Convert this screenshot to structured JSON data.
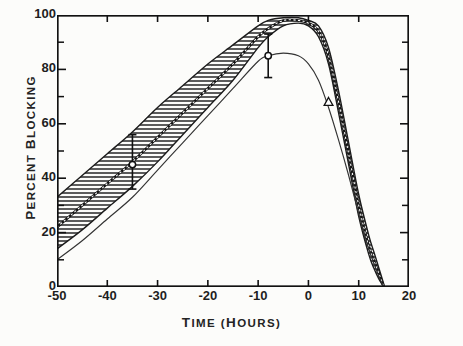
{
  "chart_data": {
    "type": "line",
    "title": "",
    "xlabel": "TIME (HOURS)",
    "ylabel": "PERCENT BLOCKING",
    "xlim": [
      -50,
      20
    ],
    "ylim": [
      0,
      100
    ],
    "xticks": [
      -50,
      -40,
      -30,
      -20,
      -10,
      0,
      10,
      20
    ],
    "xtick_labels": [
      "-50",
      "-40",
      "-30",
      "-20",
      "-10",
      "0",
      "10",
      "20"
    ],
    "yticks": [
      0,
      20,
      40,
      60,
      80,
      100
    ],
    "ytick_labels": [
      "0",
      "20",
      "40",
      "60",
      "80",
      "100"
    ],
    "yminor_ticks": [
      10,
      30,
      50,
      70,
      90
    ],
    "grid": false,
    "legend": "none",
    "series": [
      {
        "name": "Upper band limit",
        "comment": "upper edge of hatched confidence band",
        "x": [
          -50,
          -45,
          -40,
          -35,
          -30,
          -25,
          -20,
          -15,
          -10,
          -8,
          -5,
          -2,
          0,
          2,
          4,
          6,
          8,
          10,
          12,
          13,
          14,
          15
        ],
        "values": [
          33,
          41,
          49,
          57,
          66,
          74,
          82,
          89,
          96,
          98,
          99,
          99,
          98,
          96,
          88,
          72,
          53,
          34,
          19,
          13,
          7,
          1
        ]
      },
      {
        "name": "Lower band limit",
        "comment": "lower edge of hatched confidence band",
        "x": [
          -50,
          -45,
          -40,
          -35,
          -30,
          -25,
          -20,
          -15,
          -10,
          -8,
          -5,
          -2,
          0,
          2,
          4,
          6,
          8,
          10,
          12,
          13,
          14,
          15
        ],
        "values": [
          14,
          21,
          29,
          37,
          46,
          56,
          66,
          76,
          88,
          92,
          96,
          97,
          96,
          92,
          82,
          64,
          45,
          26,
          12,
          7,
          3,
          0
        ]
      },
      {
        "name": "Band centre curve",
        "comment": "solid mean line drawn through the hatched band",
        "x": [
          -50,
          -45,
          -40,
          -35,
          -30,
          -25,
          -20,
          -15,
          -10,
          -8,
          -5,
          -2,
          0,
          2,
          4,
          6,
          8,
          10,
          12,
          14,
          15
        ],
        "values": [
          22,
          30,
          38,
          46,
          55,
          64,
          73,
          82,
          92,
          95,
          98,
          98,
          97,
          94,
          85,
          68,
          49,
          30,
          15,
          5,
          0
        ]
      },
      {
        "name": "Lower thin curve",
        "comment": "separate thin curve peaking near 86 percent",
        "x": [
          -50,
          -45,
          -40,
          -35,
          -30,
          -25,
          -20,
          -15,
          -10,
          -8,
          -5,
          -2,
          0,
          2,
          4,
          6,
          8,
          10,
          12,
          14,
          15
        ],
        "values": [
          10,
          17,
          25,
          33,
          43,
          53,
          63,
          73,
          83,
          85,
          86,
          85,
          82,
          76,
          66,
          54,
          41,
          27,
          14,
          4,
          0
        ]
      }
    ],
    "data_points": [
      {
        "label": "point-1",
        "x": -35,
        "y": 45,
        "yerr_low": 36,
        "yerr_high": 56,
        "marker": "open-circle"
      },
      {
        "label": "point-2",
        "x": -8,
        "y": 85,
        "yerr_low": 77,
        "yerr_high": 93,
        "marker": "open-circle"
      },
      {
        "label": "point-3",
        "x": 4,
        "y": 68,
        "yerr_low": 68,
        "yerr_high": 68,
        "marker": "open-triangle"
      }
    ]
  },
  "axis": {
    "y_title": "PERCENT BLOCKING",
    "x_title": "TIME (HOURS)"
  },
  "colors": {
    "ink": "#1a1a1a",
    "background": "#fcfcfa",
    "hatch": "#2b2b2b"
  }
}
